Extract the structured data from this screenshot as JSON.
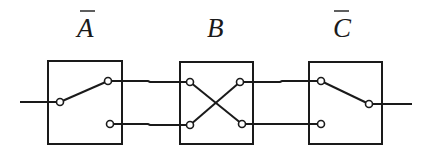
{
  "diagram": {
    "type": "switch-network",
    "colors": {
      "stroke": "#1a1a1a",
      "background": "#ffffff"
    },
    "switches": [
      {
        "id": "A",
        "label": "A",
        "negated": true,
        "kind": "single-pole-double-throw",
        "state": "input connected to upper output"
      },
      {
        "id": "B",
        "label": "B",
        "negated": false,
        "kind": "crossover",
        "state": "upper-left to lower-right, lower-left to upper-right"
      },
      {
        "id": "C",
        "label": "C",
        "negated": true,
        "kind": "single-pole-double-throw",
        "state": "upper input connected to output"
      }
    ],
    "connections": [
      {
        "from": "input",
        "to": "A.in"
      },
      {
        "from": "A.out_top",
        "to": "B.in_top"
      },
      {
        "from": "A.out_bottom",
        "to": "B.in_bottom"
      },
      {
        "from": "B.out_top",
        "to": "C.in_top"
      },
      {
        "from": "B.out_bottom",
        "to": "C.in_bottom"
      },
      {
        "from": "C.out",
        "to": "output"
      }
    ]
  }
}
